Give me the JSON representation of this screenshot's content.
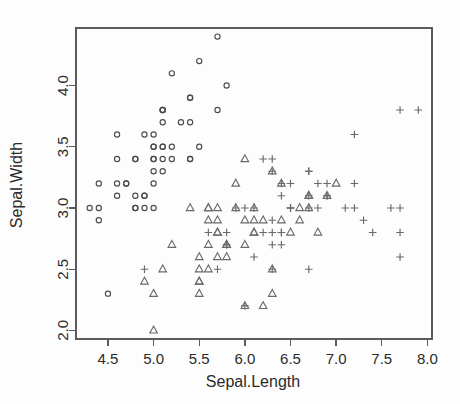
{
  "chart_data": {
    "type": "scatter",
    "title": "",
    "xlabel": "Sepal.Length",
    "ylabel": "Sepal.Width",
    "xlim": [
      4.15,
      8.05
    ],
    "ylim": [
      1.93,
      4.47
    ],
    "xticks": [
      4.5,
      5.0,
      5.5,
      6.0,
      6.5,
      7.0,
      7.5,
      8.0
    ],
    "xticklabels": [
      "4.5",
      "5.0",
      "5.5",
      "6.0",
      "6.5",
      "7.0",
      "7.5",
      "8.0"
    ],
    "yticks": [
      2.0,
      2.5,
      3.0,
      3.5,
      4.0
    ],
    "yticklabels": [
      "2.0",
      "2.5",
      "3.0",
      "3.5",
      "4.0"
    ],
    "grid": false,
    "legend": null,
    "legend_position": "none",
    "frame": "box",
    "marker_colors": {
      "setosa": "#4d4d4d",
      "versicolor": "#6a6a6a",
      "virginica": "#6a6a6a"
    },
    "series": [
      {
        "name": "setosa",
        "marker": "circle",
        "points": [
          [
            5.1,
            3.5
          ],
          [
            4.9,
            3.0
          ],
          [
            4.7,
            3.2
          ],
          [
            4.6,
            3.1
          ],
          [
            5.0,
            3.6
          ],
          [
            5.4,
            3.9
          ],
          [
            4.6,
            3.4
          ],
          [
            5.0,
            3.4
          ],
          [
            4.4,
            2.9
          ],
          [
            4.9,
            3.1
          ],
          [
            5.4,
            3.7
          ],
          [
            4.8,
            3.4
          ],
          [
            4.8,
            3.0
          ],
          [
            4.3,
            3.0
          ],
          [
            5.8,
            4.0
          ],
          [
            5.7,
            4.4
          ],
          [
            5.4,
            3.9
          ],
          [
            5.1,
            3.5
          ],
          [
            5.7,
            3.8
          ],
          [
            5.1,
            3.8
          ],
          [
            5.4,
            3.4
          ],
          [
            5.1,
            3.7
          ],
          [
            4.6,
            3.6
          ],
          [
            5.1,
            3.3
          ],
          [
            4.8,
            3.4
          ],
          [
            5.0,
            3.0
          ],
          [
            5.0,
            3.4
          ],
          [
            5.2,
            3.5
          ],
          [
            5.2,
            3.4
          ],
          [
            4.7,
            3.2
          ],
          [
            4.8,
            3.1
          ],
          [
            5.4,
            3.4
          ],
          [
            5.2,
            4.1
          ],
          [
            5.5,
            4.2
          ],
          [
            4.9,
            3.1
          ],
          [
            5.0,
            3.2
          ],
          [
            5.5,
            3.5
          ],
          [
            4.9,
            3.6
          ],
          [
            4.4,
            3.0
          ],
          [
            5.1,
            3.4
          ],
          [
            5.0,
            3.5
          ],
          [
            4.5,
            2.3
          ],
          [
            4.4,
            3.2
          ],
          [
            5.0,
            3.5
          ],
          [
            5.1,
            3.8
          ],
          [
            4.8,
            3.0
          ],
          [
            5.1,
            3.8
          ],
          [
            4.6,
            3.2
          ],
          [
            5.3,
            3.7
          ],
          [
            5.0,
            3.3
          ]
        ]
      },
      {
        "name": "versicolor",
        "marker": "triangle",
        "points": [
          [
            7.0,
            3.2
          ],
          [
            6.4,
            3.2
          ],
          [
            6.9,
            3.1
          ],
          [
            5.5,
            2.3
          ],
          [
            6.5,
            2.8
          ],
          [
            5.7,
            2.8
          ],
          [
            6.3,
            3.3
          ],
          [
            4.9,
            2.4
          ],
          [
            6.6,
            2.9
          ],
          [
            5.2,
            2.7
          ],
          [
            5.0,
            2.0
          ],
          [
            5.9,
            3.0
          ],
          [
            6.0,
            2.2
          ],
          [
            6.1,
            2.9
          ],
          [
            5.6,
            2.9
          ],
          [
            6.7,
            3.1
          ],
          [
            5.6,
            3.0
          ],
          [
            5.8,
            2.7
          ],
          [
            6.2,
            2.2
          ],
          [
            5.6,
            2.5
          ],
          [
            5.9,
            3.2
          ],
          [
            6.1,
            2.8
          ],
          [
            6.3,
            2.5
          ],
          [
            6.1,
            2.8
          ],
          [
            6.4,
            2.9
          ],
          [
            6.6,
            3.0
          ],
          [
            6.8,
            2.8
          ],
          [
            6.7,
            3.0
          ],
          [
            6.0,
            2.9
          ],
          [
            5.7,
            2.6
          ],
          [
            5.5,
            2.4
          ],
          [
            5.5,
            2.4
          ],
          [
            5.8,
            2.7
          ],
          [
            6.0,
            2.7
          ],
          [
            5.4,
            3.0
          ],
          [
            6.0,
            3.4
          ],
          [
            6.7,
            3.1
          ],
          [
            6.3,
            2.3
          ],
          [
            5.6,
            3.0
          ],
          [
            5.5,
            2.5
          ],
          [
            5.5,
            2.6
          ],
          [
            6.1,
            3.0
          ],
          [
            5.8,
            2.6
          ],
          [
            5.0,
            2.3
          ],
          [
            5.6,
            2.7
          ],
          [
            5.7,
            3.0
          ],
          [
            5.7,
            2.9
          ],
          [
            6.2,
            2.9
          ],
          [
            5.1,
            2.5
          ],
          [
            5.7,
            2.8
          ]
        ]
      },
      {
        "name": "virginica",
        "marker": "plus",
        "points": [
          [
            6.3,
            3.3
          ],
          [
            5.8,
            2.7
          ],
          [
            7.1,
            3.0
          ],
          [
            6.3,
            2.9
          ],
          [
            6.5,
            3.0
          ],
          [
            7.6,
            3.0
          ],
          [
            4.9,
            2.5
          ],
          [
            7.3,
            2.9
          ],
          [
            6.7,
            2.5
          ],
          [
            7.2,
            3.6
          ],
          [
            6.5,
            3.2
          ],
          [
            6.4,
            2.7
          ],
          [
            6.8,
            3.0
          ],
          [
            5.7,
            2.5
          ],
          [
            5.8,
            2.8
          ],
          [
            6.4,
            3.2
          ],
          [
            6.5,
            3.0
          ],
          [
            7.7,
            3.8
          ],
          [
            7.7,
            2.6
          ],
          [
            6.0,
            2.2
          ],
          [
            6.9,
            3.2
          ],
          [
            5.6,
            2.8
          ],
          [
            7.7,
            2.8
          ],
          [
            6.3,
            2.7
          ],
          [
            6.7,
            3.3
          ],
          [
            7.2,
            3.2
          ],
          [
            6.2,
            2.8
          ],
          [
            6.1,
            3.0
          ],
          [
            6.4,
            2.8
          ],
          [
            7.2,
            3.0
          ],
          [
            7.4,
            2.8
          ],
          [
            7.9,
            3.8
          ],
          [
            6.4,
            2.8
          ],
          [
            6.3,
            2.8
          ],
          [
            6.1,
            2.6
          ],
          [
            7.7,
            3.0
          ],
          [
            6.3,
            3.4
          ],
          [
            6.4,
            3.1
          ],
          [
            6.0,
            3.0
          ],
          [
            6.9,
            3.1
          ],
          [
            6.7,
            3.1
          ],
          [
            6.9,
            3.1
          ],
          [
            5.8,
            2.7
          ],
          [
            6.8,
            3.2
          ],
          [
            6.7,
            3.3
          ],
          [
            6.7,
            3.0
          ],
          [
            6.3,
            2.5
          ],
          [
            6.5,
            3.0
          ],
          [
            6.2,
            3.4
          ],
          [
            5.9,
            3.0
          ]
        ]
      }
    ]
  }
}
